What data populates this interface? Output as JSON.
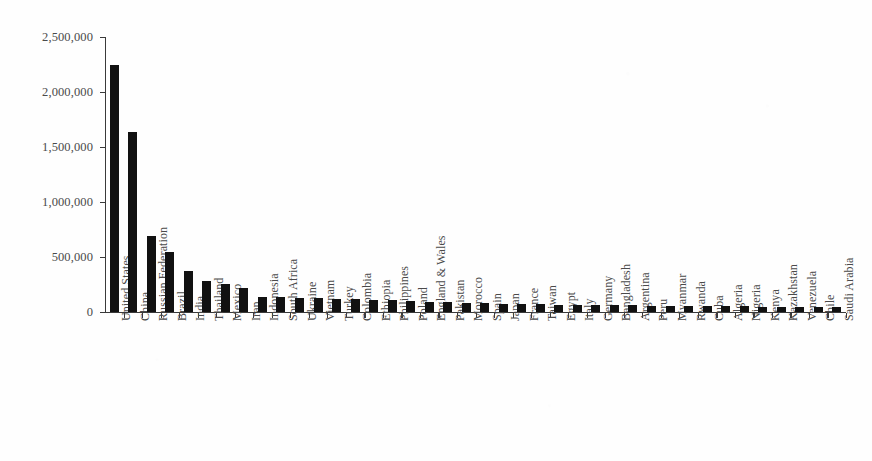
{
  "chart_data": {
    "type": "bar",
    "title": "",
    "subtitle": "",
    "xlabel": "",
    "ylabel": "",
    "ylim": [
      0,
      2500000
    ],
    "grid": false,
    "legend": false,
    "legend_position": "none",
    "bar_color": "#111111",
    "axis_color": "#3a3a3a",
    "label_color": "#4a4a4a",
    "ytick_labels": [
      "0",
      "500,000",
      "1,000,000",
      "1,500,000",
      "2,000,000",
      "2,500,000"
    ],
    "ytick_values": [
      0,
      500000,
      1000000,
      1500000,
      2000000,
      2500000
    ],
    "categories": [
      "United States",
      "China",
      "Russian Federation",
      "Brazil",
      "India",
      "Thailand",
      "Mexico",
      "Iran",
      "Indonesia",
      "South Africa",
      "Ukraine",
      "Vietnam",
      "Turkey",
      "Colombia",
      "Ethiopia",
      "Philippines",
      "Poland",
      "England & Wales",
      "Pakistan",
      "Morocco",
      "Spain",
      "Japan",
      "France",
      "Taiwan",
      "Egypt",
      "Italy",
      "Germany",
      "Bangladesh",
      "Argentina",
      "Peru",
      "Myanmar",
      "Rwanda",
      "Cuba",
      "Algeria",
      "Nigeria",
      "Kenya",
      "Kazakhstan",
      "Venezuela",
      "Chile",
      "Saudi Arabia"
    ],
    "values": [
      2250000,
      1640000,
      690000,
      545000,
      375000,
      280000,
      255000,
      215000,
      140000,
      135000,
      130000,
      125000,
      120000,
      115000,
      110000,
      105000,
      100000,
      95000,
      88000,
      82000,
      78000,
      75000,
      72000,
      70000,
      68000,
      66000,
      64000,
      62000,
      60000,
      58000,
      56000,
      55000,
      53000,
      52000,
      51000,
      50000,
      49000,
      48000,
      47000,
      46000
    ]
  }
}
